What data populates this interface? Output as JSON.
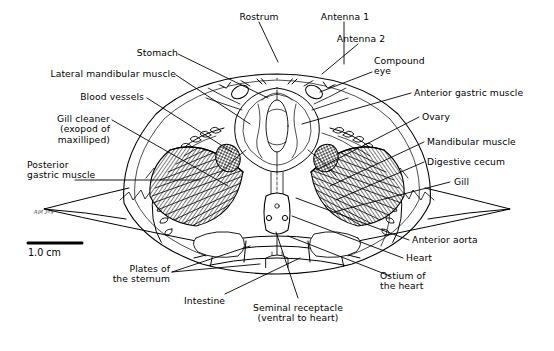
{
  "figure": {
    "organism": "crayfish",
    "view": "dorsal dissected view",
    "ink_color": "#000000",
    "background_color": "#ffffff"
  },
  "scale": {
    "label": "1.0 cm",
    "signature": "Apt Joy"
  },
  "labels": {
    "rostrum": "Rostrum",
    "antenna1": "Antenna 1",
    "antenna2": "Antenna 2",
    "compound_eye": "Compound\neye",
    "stomach": "Stomach",
    "lateral_mandibular_muscle": "Lateral mandibular muscle",
    "blood_vessels": "Blood vessels",
    "gill_cleaner": "Gill cleaner\n(exopod of\nmaxilliped)",
    "posterior_gastric_muscle": "Posterior\ngastric muscle",
    "anterior_gastric_muscle": "Anterior gastric muscle",
    "ovary": "Ovary",
    "mandibular_muscle": "Mandibular muscle",
    "digestive_cecum": "Digestive cecum",
    "gill": "Gill",
    "anterior_aorta": "Anterior aorta",
    "heart": "Heart",
    "ostium_of_the_heart": "Ostium of\nthe heart",
    "seminal_receptacle": "Seminal receptacle\n(ventral to heart)",
    "plates_of_the_sternum": "Plates of\nthe sternum",
    "intestine": "Intestine"
  }
}
